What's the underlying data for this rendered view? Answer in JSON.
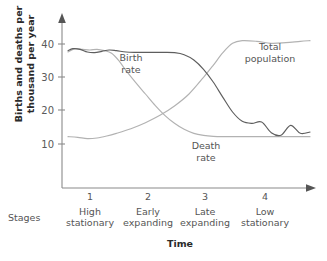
{
  "chart_data": {
    "type": "line",
    "title": "",
    "xlabel": "Time",
    "ylabel": "Births and deaths per\nthousand per year",
    "ylim": [
      0,
      45
    ],
    "yticks": [
      10,
      20,
      30,
      40
    ],
    "ytick_labels": [
      "10",
      "20",
      "30",
      "40"
    ],
    "grid": false,
    "legend_position": "inline-annotations",
    "stages_caption": "Stages",
    "stages": [
      {
        "number": "1",
        "name": "High\nstationary"
      },
      {
        "number": "2",
        "name": "Early\nexpanding"
      },
      {
        "number": "3",
        "name": "Late\nexpanding"
      },
      {
        "number": "4",
        "name": "Low\nstationary"
      }
    ],
    "series": [
      {
        "name": "Birth rate",
        "label": "Birth\nrate",
        "color": "#5e5e5e",
        "x": [
          0,
          2,
          5,
          8,
          11,
          14,
          17,
          20,
          24,
          28,
          32,
          36,
          40,
          44,
          48,
          52,
          56,
          60,
          64,
          68,
          72,
          76,
          80,
          84,
          88,
          92,
          96,
          100
        ],
        "values": [
          38,
          38.6,
          38.4,
          37.6,
          37.4,
          37.8,
          38.2,
          38.0,
          37.6,
          37.5,
          37.5,
          37.5,
          37.5,
          37.4,
          36.8,
          35.2,
          32.4,
          28.6,
          24.0,
          19.6,
          16.8,
          16.2,
          16.6,
          13.4,
          12.6,
          15.6,
          13.2,
          13.6
        ]
      },
      {
        "name": "Death rate",
        "label": "Death\nrate",
        "color": "#b2b2b2",
        "x": [
          0,
          3,
          6,
          9,
          12,
          15,
          18,
          21,
          24,
          28,
          32,
          36,
          40,
          44,
          48,
          52,
          56,
          60,
          64,
          70,
          76,
          84,
          92,
          100
        ],
        "values": [
          37.6,
          38.6,
          38.4,
          38.2,
          38.4,
          38.0,
          37.2,
          35.0,
          32.0,
          28.4,
          25.0,
          21.6,
          18.6,
          16.2,
          14.4,
          13.2,
          12.6,
          12.3,
          12.2,
          12.2,
          12.2,
          12.2,
          12.2,
          12.2
        ]
      },
      {
        "name": "Total population",
        "label": "Total\npopulation",
        "color": "#b2b2b2",
        "x": [
          0,
          4,
          8,
          12,
          16,
          20,
          26,
          32,
          38,
          44,
          50,
          56,
          60,
          64,
          68,
          72,
          78,
          84,
          90,
          96,
          100
        ],
        "values": [
          12.2,
          12.0,
          11.6,
          11.8,
          12.4,
          13.2,
          14.6,
          16.4,
          18.6,
          21.4,
          25.0,
          30.0,
          33.6,
          37.4,
          40.2,
          41.0,
          40.8,
          40.2,
          40.4,
          40.8,
          41.0
        ]
      }
    ]
  }
}
